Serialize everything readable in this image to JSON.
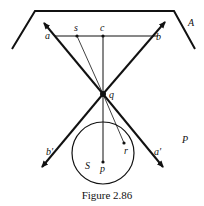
{
  "figure": {
    "caption": "Figure 2.86",
    "labels": {
      "A": "A",
      "P": "P",
      "a": "a",
      "s": "s",
      "c": "c",
      "b": "b",
      "q": "q",
      "b_prime": "b′",
      "a_prime": "a′",
      "r": "r",
      "S": "S",
      "p": "p"
    }
  }
}
